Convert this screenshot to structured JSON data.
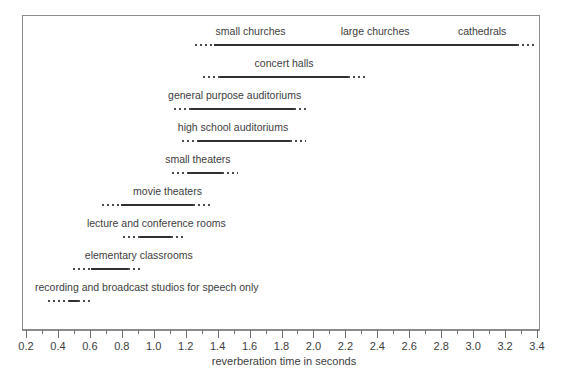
{
  "chart_data": {
    "type": "bar",
    "title": "",
    "xlabel": "reverberation time in seconds",
    "ylabel": "",
    "xlim": [
      0.2,
      3.4
    ],
    "grid": false,
    "legend": null,
    "orientation": "horizontal-range",
    "note": "Each row is a recommended reverberation-time range. The solid segment is the core recommended range; the dotted segments at each end are the tolerance / fuzzy extension of that range.",
    "axis": {
      "major_ticks": [
        0.2,
        0.4,
        0.6,
        0.8,
        1.0,
        1.2,
        1.4,
        1.6,
        1.8,
        2.0,
        2.2,
        2.4,
        2.6,
        2.8,
        3.0,
        3.2,
        3.4
      ],
      "major_tick_labels": [
        "0.2",
        "0.4",
        "0.6",
        "0.8",
        "1.0",
        "1.2",
        "1.4",
        "1.6",
        "1.8",
        "2.0",
        "2.2",
        "2.4",
        "2.6",
        "2.8",
        "3.0",
        "3.2",
        "3.4"
      ],
      "minor_tick_step": 0.1
    },
    "categories": [
      "small churches",
      "large churches",
      "cathedrals",
      "concert halls",
      "general purpose auditoriums",
      "high school auditoriums",
      "small theaters",
      "movie theaters",
      "lecture and conference rooms",
      "elementary classrooms",
      "recording and broadcast studios for speech only"
    ],
    "rows": [
      {
        "row_index": 0,
        "labels": [
          {
            "text": "small churches",
            "at": 1.6
          },
          {
            "text": "large churches",
            "at": 2.38
          },
          {
            "text": "cathedrals",
            "at": 3.05
          }
        ],
        "dot_start": 1.25,
        "solid_start": 1.37,
        "solid_end": 3.27,
        "dot_end": 3.39
      },
      {
        "row_index": 1,
        "labels": [
          {
            "text": "concert halls",
            "at": 1.81
          }
        ],
        "dot_start": 1.3,
        "solid_start": 1.41,
        "solid_end": 2.21,
        "dot_end": 2.33
      },
      {
        "row_index": 2,
        "labels": [
          {
            "text": "general purpose auditoriums",
            "at": 1.5
          }
        ],
        "dot_start": 1.12,
        "solid_start": 1.23,
        "solid_end": 1.87,
        "dot_end": 1.95
      },
      {
        "row_index": 3,
        "labels": [
          {
            "text": "high school auditoriums",
            "at": 1.49
          }
        ],
        "dot_start": 1.17,
        "solid_start": 1.27,
        "solid_end": 1.85,
        "dot_end": 1.95
      },
      {
        "row_index": 4,
        "labels": [
          {
            "text": "small theaters",
            "at": 1.27
          }
        ],
        "dot_start": 1.11,
        "solid_start": 1.21,
        "solid_end": 1.42,
        "dot_end": 1.52
      },
      {
        "row_index": 5,
        "labels": [
          {
            "text": "movie theaters",
            "at": 1.08
          }
        ],
        "dot_start": 0.67,
        "solid_start": 0.79,
        "solid_end": 1.24,
        "dot_end": 1.35
      },
      {
        "row_index": 6,
        "labels": [
          {
            "text": "lecture and conference rooms",
            "at": 1.01
          }
        ],
        "dot_start": 0.8,
        "solid_start": 0.91,
        "solid_end": 1.1,
        "dot_end": 1.19
      },
      {
        "row_index": 7,
        "labels": [
          {
            "text": "elementary classrooms",
            "at": 0.9
          }
        ],
        "dot_start": 0.49,
        "solid_start": 0.6,
        "solid_end": 0.83,
        "dot_end": 0.92
      },
      {
        "row_index": 8,
        "labels": [
          {
            "text": "recording and broadcast studios for speech only",
            "at": 0.95
          }
        ],
        "dot_start": 0.33,
        "solid_start": 0.46,
        "solid_end": 0.52,
        "dot_end": 0.6
      }
    ]
  },
  "colors": {
    "bar_solid": "#2f2f2f",
    "bar_dotted": "#4a4a4a",
    "frame": "#8c8c8c",
    "text": "#3d3d3d",
    "background": "#ffffff"
  }
}
